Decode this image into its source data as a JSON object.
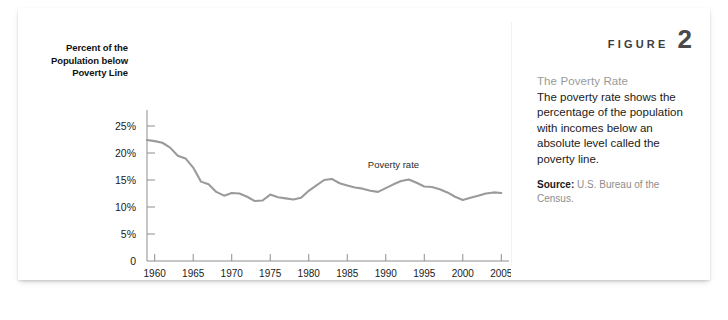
{
  "figure": {
    "word": "FIGURE",
    "number": "2"
  },
  "caption": {
    "heading": "The Poverty Rate",
    "text": "The poverty rate shows the percentage of the population with incomes below an absolute level called the poverty line.",
    "source_label": "Source:",
    "source_text": " U.S. Bureau of the Census."
  },
  "colors": {
    "line": "#9a9a9a",
    "axis": "#8e8e8e",
    "heading": "#9a9a9a",
    "figure_number": "#4a4a4a",
    "card_background": "#ffffff"
  },
  "chart_data": {
    "type": "line",
    "title": "",
    "xlabel": "",
    "ylabel": "Percent of the Population below Poverty Line",
    "ylim": [
      0,
      27
    ],
    "xlim": [
      1959,
      2006
    ],
    "grid": false,
    "legend": "inline-label",
    "y_tick_labels": [
      "0",
      "5%",
      "10%",
      "15%",
      "20%",
      "25%"
    ],
    "y_tick_values": [
      0,
      5,
      10,
      15,
      20,
      25
    ],
    "x_tick_labels": [
      "1960",
      "1965",
      "1970",
      "1975",
      "1980",
      "1985",
      "1990",
      "1995",
      "2000",
      "2005"
    ],
    "x_tick_values": [
      1960,
      1965,
      1970,
      1975,
      1980,
      1985,
      1990,
      1995,
      2000,
      2005
    ],
    "series": [
      {
        "name": "Poverty rate",
        "x": [
          1959,
          1960,
          1961,
          1962,
          1963,
          1964,
          1965,
          1966,
          1967,
          1968,
          1969,
          1970,
          1971,
          1972,
          1973,
          1974,
          1975,
          1976,
          1977,
          1978,
          1979,
          1980,
          1981,
          1982,
          1983,
          1984,
          1985,
          1986,
          1987,
          1988,
          1989,
          1990,
          1991,
          1992,
          1993,
          1994,
          1995,
          1996,
          1997,
          1998,
          1999,
          2000,
          2001,
          2002,
          2003,
          2004,
          2005
        ],
        "values": [
          22.4,
          22.2,
          21.9,
          21.0,
          19.5,
          19.0,
          17.3,
          14.7,
          14.2,
          12.8,
          12.1,
          12.6,
          12.5,
          11.9,
          11.1,
          11.2,
          12.3,
          11.8,
          11.6,
          11.4,
          11.7,
          13.0,
          14.0,
          15.0,
          15.2,
          14.4,
          14.0,
          13.6,
          13.4,
          13.0,
          12.8,
          13.5,
          14.2,
          14.8,
          15.1,
          14.5,
          13.8,
          13.7,
          13.3,
          12.7,
          11.9,
          11.3,
          11.7,
          12.1,
          12.5,
          12.7,
          12.6
        ]
      }
    ],
    "annotations": [
      {
        "text": "Poverty rate",
        "x": 1991,
        "y": 17.3
      }
    ]
  }
}
